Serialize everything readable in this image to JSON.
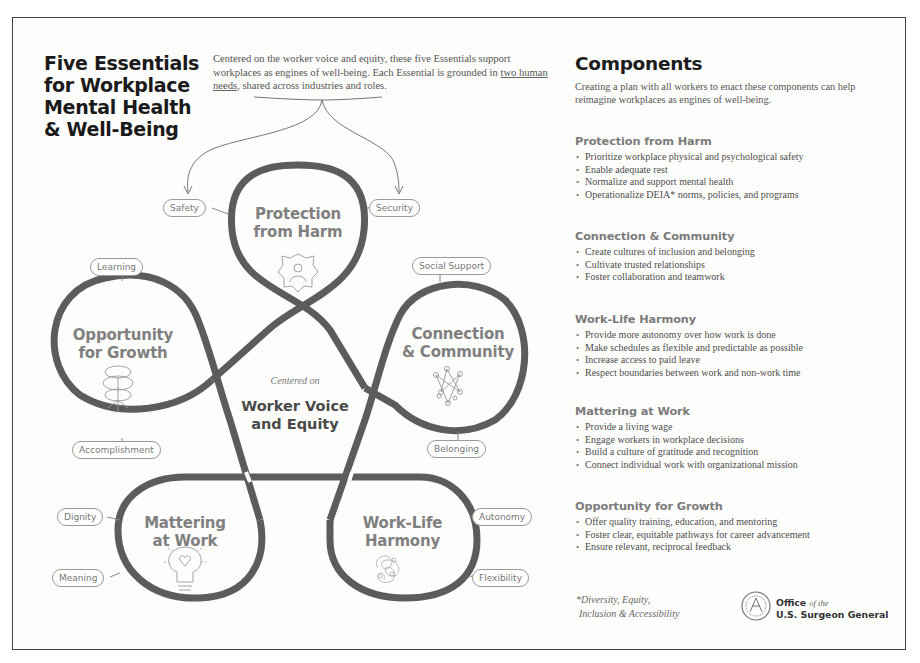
{
  "header": {
    "title_lines": [
      "Five Essentials",
      "for Workplace",
      "Mental Health",
      "& Well-Being"
    ],
    "intro_part1": "Centered on the worker voice and equity, these five Essentials support workplaces as engines of well-being. Each Essential is grounded in ",
    "intro_underlined": "two human needs",
    "intro_part2": ", shared across industries and roles."
  },
  "diagram": {
    "center": {
      "small": "Centered on",
      "big_line1": "Worker Voice",
      "big_line2": "and Equity"
    },
    "essentials": [
      {
        "id": "protection",
        "line1": "Protection",
        "line2": "from Harm",
        "icon": "shield-person-icon",
        "needs": [
          "Safety",
          "Security"
        ]
      },
      {
        "id": "connection",
        "line1": "Connection",
        "line2": "& Community",
        "icon": "network-icon",
        "needs": [
          "Social Support",
          "Belonging"
        ]
      },
      {
        "id": "worklife",
        "line1": "Work-Life",
        "line2": "Harmony",
        "icon": "tangle-icon",
        "needs": [
          "Autonomy",
          "Flexibility"
        ]
      },
      {
        "id": "mattering",
        "line1": "Mattering",
        "line2": "at Work",
        "icon": "lightbulb-heart-icon",
        "needs": [
          "Dignity",
          "Meaning"
        ]
      },
      {
        "id": "growth",
        "line1": "Opportunity",
        "line2": "for Growth",
        "icon": "flower-icon",
        "needs": [
          "Learning",
          "Accomplishment"
        ]
      }
    ],
    "colors": {
      "band": "#5a5a5a",
      "label": "#808080",
      "pill_border": "#999999"
    }
  },
  "components": {
    "title": "Components",
    "intro": "Creating a plan with all workers to enact these components can help reimagine workplaces as engines of well-being.",
    "sections": [
      {
        "heading": "Protection from Harm",
        "items": [
          "Prioritize workplace physical and psychological safety",
          "Enable adequate rest",
          "Normalize and support mental health",
          "Operationalize DEIA* norms, policies, and programs"
        ]
      },
      {
        "heading": "Connection & Community",
        "items": [
          "Create cultures of inclusion and belonging",
          "Cultivate trusted relationships",
          "Foster collaboration and teamwork"
        ]
      },
      {
        "heading": "Work-Life Harmony",
        "items": [
          "Provide more autonomy over how work is done",
          "Make schedules as flexible and predictable as possible",
          "Increase access to paid leave",
          "Respect boundaries between work and non-work time"
        ]
      },
      {
        "heading": "Mattering at Work",
        "items": [
          "Provide a living wage",
          "Engage workers in workplace decisions",
          "Build a culture of gratitude and recognition",
          "Connect individual work with organizational mission"
        ]
      },
      {
        "heading": "Opportunity for Growth",
        "items": [
          "Offer quality training, education, and mentoring",
          "Foster clear, equitable pathways for career advancement",
          "Ensure relevant, reciprocal feedback"
        ]
      }
    ],
    "footnote_line1": "*Diversity, Equity,",
    "footnote_line2": "Inclusion & Accessibility"
  },
  "footer": {
    "org_line1_bold": "Office",
    "org_line1_italic": "of the",
    "org_line2": "U.S. Surgeon General",
    "seal_icon": "surgeon-general-seal-icon"
  }
}
